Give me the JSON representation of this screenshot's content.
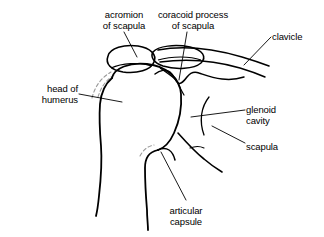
{
  "figure": {
    "background_color": "#ffffff",
    "line_color": "#000000",
    "hidden_line_color": "#9a9a9a",
    "text_color": "#000000",
    "width": 324,
    "height": 237
  },
  "labels": {
    "acromion": {
      "line1": "acromion",
      "line2": "of scapula"
    },
    "coracoid": {
      "line1": "coracoid process",
      "line2": "of scapula"
    },
    "clavicle": {
      "line1": "clavicle"
    },
    "head_of_humerus": {
      "line1": "head of",
      "line2": "humerus"
    },
    "glenoid_cavity": {
      "line1": "glenoid",
      "line2": "cavity"
    },
    "scapula": {
      "line1": "scapula"
    },
    "articular_capsule": {
      "line1": "articular",
      "line2": "capsule"
    }
  },
  "structures": [
    "acromion of scapula",
    "coracoid process of scapula",
    "clavicle",
    "head of humerus",
    "glenoid cavity",
    "scapula",
    "articular capsule"
  ]
}
